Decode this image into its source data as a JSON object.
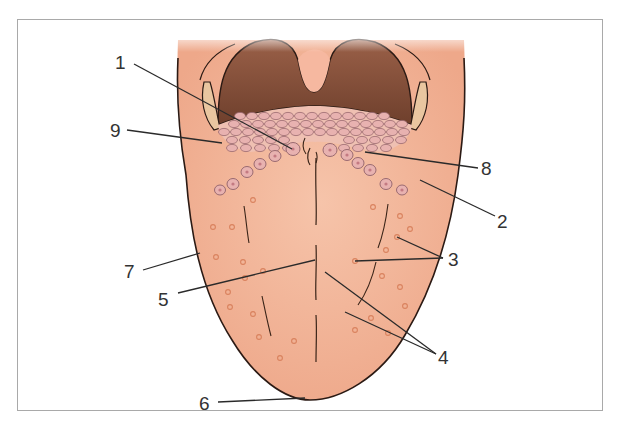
{
  "figure": {
    "colors": {
      "tongue_fill": "#f2b79a",
      "tongue_shade": "#e8a082",
      "outline": "#2b1a14",
      "pharynx_dark": "#7a4a35",
      "pharynx_mid": "#9a6048",
      "uvula": "#f6b8a0",
      "tonsil": "#e9c6a0",
      "papilla_fill": "#e8b2b0",
      "papilla_stroke": "#9a6a70",
      "fungiform": "#d9825e",
      "frame": "#a9a9a9",
      "label": "#333333"
    },
    "labels": [
      {
        "id": "1",
        "text": "1"
      },
      {
        "id": "2",
        "text": "2"
      },
      {
        "id": "3",
        "text": "3"
      },
      {
        "id": "4",
        "text": "4"
      },
      {
        "id": "5",
        "text": "5"
      },
      {
        "id": "6",
        "text": "6"
      },
      {
        "id": "7",
        "text": "7"
      },
      {
        "id": "8",
        "text": "8"
      },
      {
        "id": "9",
        "text": "9"
      }
    ]
  }
}
